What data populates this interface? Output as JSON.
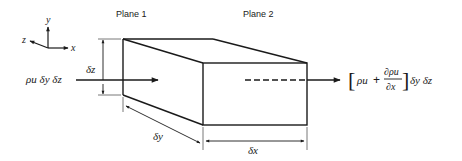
{
  "diagram": {
    "axes": {
      "x": "x",
      "y": "y",
      "z": "z"
    },
    "planes": {
      "plane1": "Plane 1",
      "plane2": "Plane 2"
    },
    "inflow": {
      "label": "ρu δy δz"
    },
    "outflow": {
      "open_bracket": "[",
      "term1": "ρu",
      "plus": "+",
      "numerator": "∂ρu",
      "denominator": "∂x",
      "close_bracket": "]",
      "tail": "δy δz"
    },
    "dimensions": {
      "dz": "δz",
      "dy": "δy",
      "dx": "δx"
    },
    "colors": {
      "ink": "#1a1a1a",
      "dim": "#333333",
      "background": "#ffffff"
    }
  }
}
